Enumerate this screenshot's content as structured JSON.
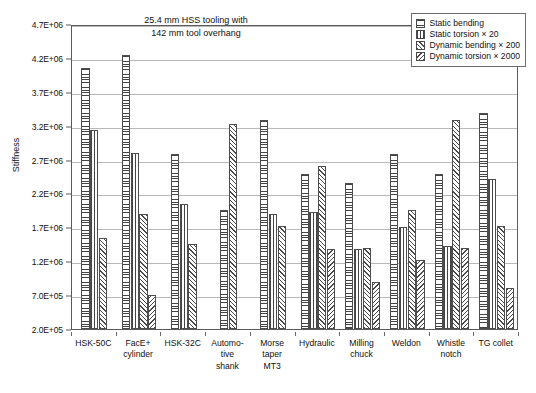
{
  "chart_data": {
    "type": "bar",
    "title": "",
    "annotation": [
      "25.4 mm HSS tooling with",
      "142 mm tool overhang"
    ],
    "xlabel": "",
    "ylabel": "Stiffness",
    "ylim": [
      200000,
      4700000
    ],
    "ytick_values": [
      200000,
      700000,
      1200000,
      1700000,
      2200000,
      2700000,
      3200000,
      3700000,
      4200000,
      4700000
    ],
    "ytick_labels": [
      "2.0E+05",
      "7.0E+05",
      "1.2E+06",
      "1.7E+06",
      "2.2E+06",
      "2.7E+06",
      "3.2E+06",
      "3.7E+06",
      "4.2E+06",
      "4.7E+06"
    ],
    "grid": true,
    "legend_position": "top-right",
    "categories": [
      "HSK-50C",
      "FacE+ cylinder",
      "HSK-32C",
      "Automo- tive shank",
      "Morse taper MT3",
      "Hydraulic",
      "Milling chuck",
      "Weldon",
      "Whistle notch",
      "TG collet"
    ],
    "category_lines": [
      [
        "HSK-50C"
      ],
      [
        "FacE+",
        "cylinder"
      ],
      [
        "HSK-32C"
      ],
      [
        "Automo-",
        "tive",
        "shank"
      ],
      [
        "Morse",
        "taper",
        "MT3"
      ],
      [
        "Hydraulic"
      ],
      [
        "Milling",
        "chuck"
      ],
      [
        "Weldon"
      ],
      [
        "Whistle",
        "notch"
      ],
      [
        "TG collet"
      ]
    ],
    "series": [
      {
        "name": "Static bending",
        "pattern": "horizontal-hatch",
        "values": [
          4050000,
          4250000,
          2780000,
          1950000,
          3280000,
          2480000,
          2350000,
          2780000,
          2480000,
          3380000
        ]
      },
      {
        "name": "Static torsion × 20",
        "pattern": "vertical-hatch",
        "values": [
          3130000,
          2800000,
          2050000,
          null,
          1900000,
          1920000,
          1380000,
          1700000,
          1420000,
          2420000
        ]
      },
      {
        "name": "Dynamic bending × 200",
        "pattern": "forward-diagonal-hatch",
        "values": [
          1550000,
          1900000,
          1450000,
          3220000,
          1720000,
          2600000,
          1400000,
          1950000,
          3280000,
          1720000
        ]
      },
      {
        "name": "Dynamic torsion × 2000",
        "pattern": "backward-diagonal-hatch",
        "values": [
          null,
          700000,
          null,
          null,
          null,
          1380000,
          900000,
          1220000,
          1400000,
          800000
        ]
      }
    ]
  },
  "legend": {
    "items": [
      {
        "label": "Static bending",
        "pattern": "horizontal-hatch"
      },
      {
        "label": "Static torsion × 20",
        "pattern": "vertical-hatch"
      },
      {
        "label": "Dynamic bending × 200",
        "pattern": "forward-diagonal-hatch"
      },
      {
        "label": "Dynamic torsion × 2000",
        "pattern": "backward-diagonal-hatch"
      }
    ]
  },
  "colors": {
    "frame": "#5a5a5a",
    "grid": "#b9b9b9",
    "bar_outline": "#4d4d4d",
    "hatch": "#444444",
    "text": "#111111",
    "background": "#ffffff"
  }
}
